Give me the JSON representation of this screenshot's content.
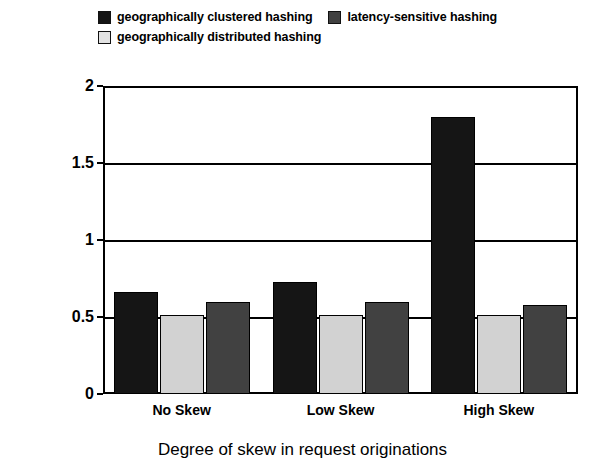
{
  "chart_data": {
    "type": "bar",
    "title": "",
    "xlabel": "Degree of skew in request originations",
    "ylabel": "Coefficient of variation of response time",
    "categories": [
      "No Skew",
      "Low Skew",
      "High Skew"
    ],
    "ylim": [
      0,
      2
    ],
    "yticks": [
      "0",
      "0.5",
      "1",
      "1.5",
      "2"
    ],
    "ytick_values": [
      0,
      0.5,
      1,
      1.5,
      2
    ],
    "grid": true,
    "legend_position": "top",
    "series": [
      {
        "name": "geographically clustered hashing",
        "color": "#151515",
        "values": [
          0.66,
          0.73,
          1.8
        ]
      },
      {
        "name": "geographically distributed hashing",
        "color": "#d2d2d2",
        "values": [
          0.51,
          0.51,
          0.51
        ]
      },
      {
        "name": "latency-sensitive hashing",
        "color": "#414141",
        "values": [
          0.6,
          0.6,
          0.58
        ]
      }
    ]
  },
  "legend": {
    "row1": [
      {
        "label": "geographically clustered hashing",
        "swatch": "#151515"
      },
      {
        "label": "latency-sensitive hashing",
        "swatch": "#414141"
      }
    ],
    "row2": [
      {
        "label": "geographically distributed hashing",
        "swatch": "#e2e2e2"
      }
    ]
  },
  "axes": {
    "y_title": "Coefficient of variation of response time",
    "x_title": "Degree of skew in request originations",
    "y_tick_0": "0",
    "y_tick_1": "0.5",
    "y_tick_2": "1",
    "y_tick_3": "1.5",
    "y_tick_4": "2",
    "x_tick_0": "No Skew",
    "x_tick_1": "Low Skew",
    "x_tick_2": "High Skew"
  }
}
